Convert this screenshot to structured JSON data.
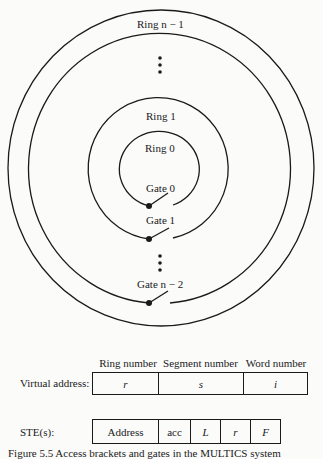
{
  "rings": [
    {
      "label": "Ring n − 1",
      "name": "ring-n-minus-1"
    },
    {
      "label": "Ring 1",
      "name": "ring-1"
    },
    {
      "label": "Ring 0",
      "name": "ring-0"
    }
  ],
  "gates": [
    {
      "label": "Gate 0"
    },
    {
      "label": "Gate 1"
    },
    {
      "label": "Gate n − 2"
    }
  ],
  "ellipsis": "⋮",
  "virtual_address": {
    "label": "Virtual address:",
    "headers": [
      "Ring number",
      "Segment number",
      "Word number"
    ],
    "fields": [
      "r",
      "s",
      "i"
    ]
  },
  "ste": {
    "label": "STE(s):",
    "fields": [
      "Address",
      "acc",
      "L",
      "r",
      "F"
    ]
  },
  "caption": "Figure 5.5 Access brackets and gates in the MULTICS system"
}
